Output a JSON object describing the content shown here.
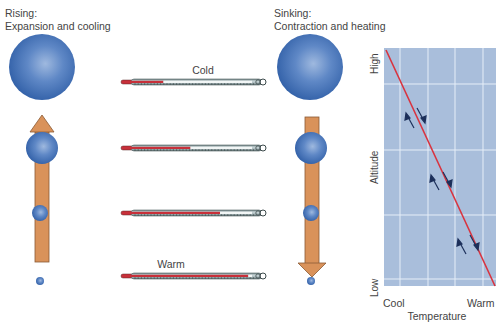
{
  "left_panel": {
    "title_line1": "Rising:",
    "title_line2": "Expansion and cooling",
    "arrow_direction": "up"
  },
  "right_panel": {
    "title_line1": "Sinking:",
    "title_line2": "Contraction and heating",
    "arrow_direction": "down"
  },
  "thermometers": {
    "top_label": "Cold",
    "bottom_label": "Warm",
    "fill_percent": [
      28,
      50,
      74,
      97
    ]
  },
  "graph": {
    "y_axis_label": "Altitude",
    "y_high": "High",
    "y_low": "Low",
    "x_axis_label": "Temperature",
    "x_cool": "Cool",
    "x_warm": "Warm"
  },
  "colors": {
    "parcel_blue": "#3f6fb5",
    "arrow_orange": "#d9925a",
    "graph_bg": "#a9bedb",
    "line_red": "#d9333f",
    "mercury_red": "#c8303a"
  }
}
